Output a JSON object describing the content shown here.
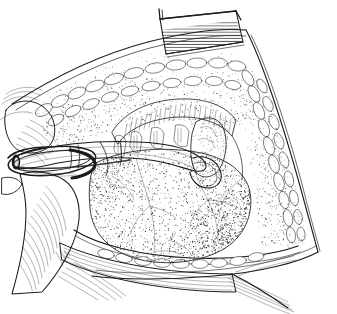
{
  "figure": {
    "domain": "Natural-Image",
    "medium": "pen-and-ink stipple line drawing",
    "palette": {
      "background": "#ffffff",
      "ink": "#1a1a1a",
      "mid_ink": "#3a3a3a",
      "light_ink": "#6e6e6e",
      "metal_highlight": "#ffffff",
      "metal_shadow": "#202020"
    },
    "canvas": {
      "width": 337,
      "height": 314
    },
    "caption": "",
    "title": "",
    "labels": []
  },
  "scene": {
    "description": "Surgical field illustration: a retracted neck/abdominal incision exposing a large stippled organ, with a ring retractor and curved cannula held by a gloved finger at left, and a hatched retractor blade at top.",
    "regions": [
      {
        "id": "wound-margin",
        "name": "wound-margin",
        "note": "Incision edge running from upper-left down to lower-right, drawn as a double contour line."
      },
      {
        "id": "subcutaneous-fat",
        "name": "subcutaneous-fat-lobules",
        "note": "Chains of rounded lobules lining the upper-left and right wound edges."
      },
      {
        "id": "organ-mass",
        "name": "stippled-organ-mass",
        "note": "Large central stippled organ with branching surface vessels."
      },
      {
        "id": "striated-band",
        "name": "striated-band",
        "note": "Vertically striated bands above the organ, resembling cartilage rings or muscle fibres."
      },
      {
        "id": "tubular-structure",
        "name": "tubular-structure",
        "note": "Pale tube/duct at upper right encircled by the instrument tip."
      }
    ],
    "instruments": [
      {
        "id": "ring-retractor",
        "name": "ring-retractor",
        "note": "Elliptical metal ring at left held open, seen in perspective."
      },
      {
        "id": "cannula",
        "name": "curved-cannula",
        "note": "Cylindrical shaft entering from the left and curving right to a hooked tip."
      },
      {
        "id": "retractor-blade",
        "name": "retractor-blade-top",
        "note": "Hatched rectangular retractor blade at top centre of the field."
      },
      {
        "id": "retractor-flap-bottom",
        "name": "retractor-flap-bottom",
        "note": "Hatched skin/fascia flap retracted along the bottom edge."
      }
    ],
    "hand": {
      "id": "gloved-finger",
      "name": "gloved-finger",
      "note": "Gloved thumb and finger at lower left steadying the ring retractor."
    }
  },
  "stipple": {
    "organ_density": 2600,
    "fat_density": 900,
    "margin_density": 700,
    "seed": 20240517
  }
}
